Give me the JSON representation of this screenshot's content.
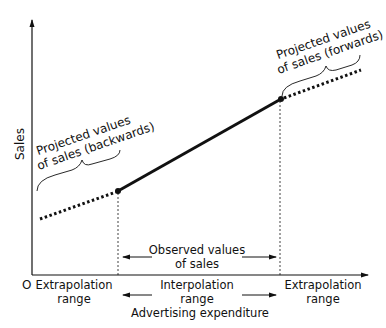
{
  "axes": {
    "y_label": "Sales",
    "x_label": "Advertising expenditure",
    "origin_label": "O"
  },
  "annotations": {
    "backwards_line1": "Projected values",
    "backwards_line2": "of sales (backwards)",
    "forwards_line1": "Projected values",
    "forwards_line2": "of sales (forwards)",
    "observed_line1": "Observed values",
    "observed_line2": "of sales"
  },
  "ranges": {
    "left_line1": "Extrapolation",
    "left_line2": "range",
    "middle_line1": "Interpolation",
    "middle_line2": "range",
    "right_line1": "Extrapolation",
    "right_line2": "range"
  },
  "colors": {
    "ink": "#111111",
    "background": "#ffffff"
  }
}
